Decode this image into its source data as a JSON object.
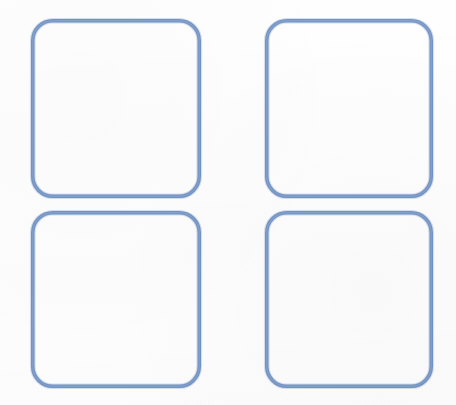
{
  "canvas": {
    "width": 456,
    "height": 405,
    "background_color": "#fefefe",
    "description": "Blank template sheet with four empty rounded-square outlines arranged in a two-by-two grid"
  },
  "style": {
    "stroke_color": "#7092c4",
    "stroke_halo_color": "#9fb6d8",
    "stroke_sheen_color": "#a8c0de",
    "stroke_width": 3.5,
    "corner_radius": 20,
    "fill": "none"
  },
  "grid": {
    "columns": 2,
    "rows": 2,
    "count": 4,
    "column_gap": 64,
    "row_gap": 13
  },
  "frames": [
    {
      "id": "frame-top-left",
      "label": "",
      "row": 1,
      "column": 1,
      "x": 31,
      "y": 19,
      "width": 170,
      "height": 179
    },
    {
      "id": "frame-top-right",
      "label": "",
      "row": 1,
      "column": 2,
      "x": 265,
      "y": 19,
      "width": 168,
      "height": 179
    },
    {
      "id": "frame-bottom-left",
      "label": "",
      "row": 2,
      "column": 1,
      "x": 31,
      "y": 211,
      "width": 170,
      "height": 177
    },
    {
      "id": "frame-bottom-right",
      "label": "",
      "row": 2,
      "column": 2,
      "x": 265,
      "y": 211,
      "width": 168,
      "height": 177
    }
  ]
}
